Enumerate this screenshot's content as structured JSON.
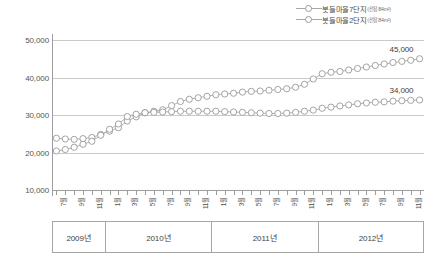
{
  "chart_data": {
    "type": "line",
    "title": "",
    "xlabel": "",
    "ylabel": "",
    "ylim": [
      10000,
      50000
    ],
    "yticks": [
      10000,
      20000,
      30000,
      40000,
      50000
    ],
    "ytick_labels": [
      "10,000",
      "20,000",
      "30,000",
      "40,000",
      "50,000"
    ],
    "grid": true,
    "legend_position": "top-right",
    "marker": "open-circle",
    "line_color": "#a8a8a8",
    "marker_edge_color": "#9a9a9a",
    "marker_face_color": "#ffffff",
    "x": [
      "2009-07",
      "2009-08",
      "2009-09",
      "2009-10",
      "2009-11",
      "2009-12",
      "2010-01",
      "2010-02",
      "2010-03",
      "2010-04",
      "2010-05",
      "2010-06",
      "2010-07",
      "2010-08",
      "2010-09",
      "2010-10",
      "2010-11",
      "2010-12",
      "2011-01",
      "2011-02",
      "2011-03",
      "2011-04",
      "2011-05",
      "2011-06",
      "2011-07",
      "2011-08",
      "2011-09",
      "2011-10",
      "2011-11",
      "2011-12",
      "2012-01",
      "2012-02",
      "2012-03",
      "2012-04",
      "2012-05",
      "2012-06",
      "2012-07",
      "2012-08",
      "2012-09",
      "2012-10",
      "2012-11",
      "2012-12"
    ],
    "xtick_labels": [
      "7월",
      "8월",
      "9월",
      "10월",
      "11월",
      "12월",
      "1월",
      "2월",
      "3월",
      "4월",
      "5월",
      "6월",
      "7월",
      "8월",
      "9월",
      "10월",
      "11월",
      "12월",
      "1월",
      "2월",
      "3월",
      "4월",
      "5월",
      "6월",
      "7월",
      "8월",
      "9월",
      "10월",
      "11월",
      "12월",
      "1월",
      "2월",
      "3월",
      "4월",
      "5월",
      "6월",
      "7월",
      "8월",
      "9월",
      "10월",
      "11월",
      "12월"
    ],
    "xtick_labels_shown": [
      "7월",
      "9월",
      "11월",
      "1월",
      "3월",
      "5월",
      "7월",
      "9월",
      "11월",
      "1월",
      "3월",
      "5월",
      "7월",
      "9월",
      "11월",
      "1월",
      "3월",
      "5월",
      "7월",
      "9월",
      "11월"
    ],
    "year_groups": [
      {
        "label": "2009년",
        "start_index": 0,
        "end_index": 5
      },
      {
        "label": "2010년",
        "start_index": 6,
        "end_index": 17
      },
      {
        "label": "2011년",
        "start_index": 18,
        "end_index": 29
      },
      {
        "label": "2012년",
        "start_index": 30,
        "end_index": 41
      }
    ],
    "series": [
      {
        "name": "봇들마을7단지",
        "sub": "(전용84m²)",
        "end_value_label": "45,000",
        "values": [
          23800,
          23600,
          23500,
          23700,
          24000,
          24800,
          25700,
          26600,
          28400,
          29500,
          30600,
          31000,
          31400,
          32500,
          33600,
          34200,
          34600,
          35000,
          35400,
          35600,
          35800,
          36100,
          36300,
          36400,
          36600,
          36800,
          37000,
          37400,
          38200,
          39600,
          41000,
          41400,
          41600,
          42000,
          42400,
          42800,
          43200,
          43600,
          44000,
          44300,
          44600,
          45000
        ]
      },
      {
        "name": "봇들마을2단지",
        "sub": "(전용84m²)",
        "end_value_label": "34,000",
        "values": [
          20400,
          20800,
          21400,
          22200,
          23000,
          24600,
          26200,
          27600,
          29600,
          30200,
          30600,
          30700,
          30800,
          30900,
          31000,
          31000,
          31000,
          31000,
          31000,
          30900,
          30800,
          30700,
          30600,
          30500,
          30400,
          30400,
          30500,
          30700,
          31000,
          31300,
          31800,
          32100,
          32400,
          32700,
          33000,
          33200,
          33400,
          33500,
          33700,
          33800,
          33900,
          34000
        ]
      }
    ]
  }
}
